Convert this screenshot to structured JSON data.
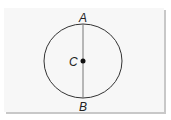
{
  "diagram": {
    "type": "circle-with-diameter",
    "points": {
      "top": {
        "label": "A"
      },
      "center": {
        "label": "C"
      },
      "bottom": {
        "label": "B"
      }
    },
    "colors": {
      "stroke": "#333333",
      "background": "#f7f7f7",
      "shadow": "#c8c8c8"
    }
  }
}
